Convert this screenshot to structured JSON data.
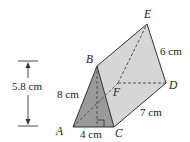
{
  "figure": {
    "type": "triangular-prism",
    "colors": {
      "background": "#ffffff",
      "front_face": "#9a9a9a",
      "side_face": "#d6d6d6",
      "top_face": "#cfcfcf",
      "edge": "#333333",
      "hidden_edge": "#444444"
    },
    "vertices": {
      "A": {
        "label": "A",
        "x": 73,
        "y": 127
      },
      "B": {
        "label": "B",
        "x": 97,
        "y": 66
      },
      "C": {
        "label": "C",
        "x": 114,
        "y": 127
      },
      "D": {
        "label": "D",
        "x": 166,
        "y": 83
      },
      "E": {
        "label": "E",
        "x": 147,
        "y": 24
      },
      "F": {
        "label": "F",
        "x": 118,
        "y": 83
      }
    },
    "measurements": {
      "height": "5.8 cm",
      "AB": "8 cm",
      "AC": "4 cm",
      "CD": "7 cm",
      "DE": "6 cm"
    },
    "annotations": {
      "right_angle_at": "foot of altitude from B on AC"
    }
  }
}
